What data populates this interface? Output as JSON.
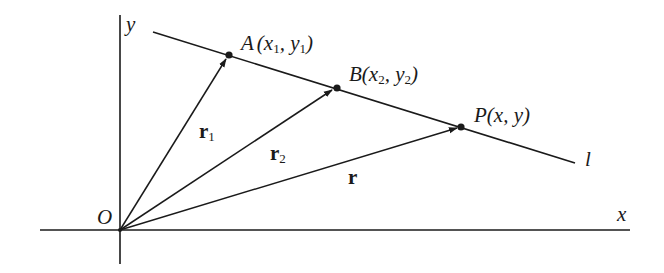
{
  "diagram": {
    "axes": {
      "x_label": "x",
      "y_label": "y",
      "origin_label": "O"
    },
    "line": {
      "label": "l"
    },
    "points": [
      {
        "id": "A",
        "label": "A",
        "coords_text": "(x",
        "sub1": "1",
        "mid": ", y",
        "sub2": "1",
        "close": ")"
      },
      {
        "id": "B",
        "label": "B",
        "coords_text": "(x",
        "sub1": "2",
        "mid": ", y",
        "sub2": "2",
        "close": ")"
      },
      {
        "id": "P",
        "label": "P",
        "coords_text": "(x, y)"
      }
    ],
    "vectors": [
      {
        "label": "r",
        "subscript": "1",
        "to": "A"
      },
      {
        "label": "r",
        "subscript": "2",
        "to": "B"
      },
      {
        "label": "r",
        "subscript": "",
        "to": "P"
      }
    ],
    "colors": {
      "stroke": "#1a1a1a",
      "background": "#ffffff"
    }
  }
}
